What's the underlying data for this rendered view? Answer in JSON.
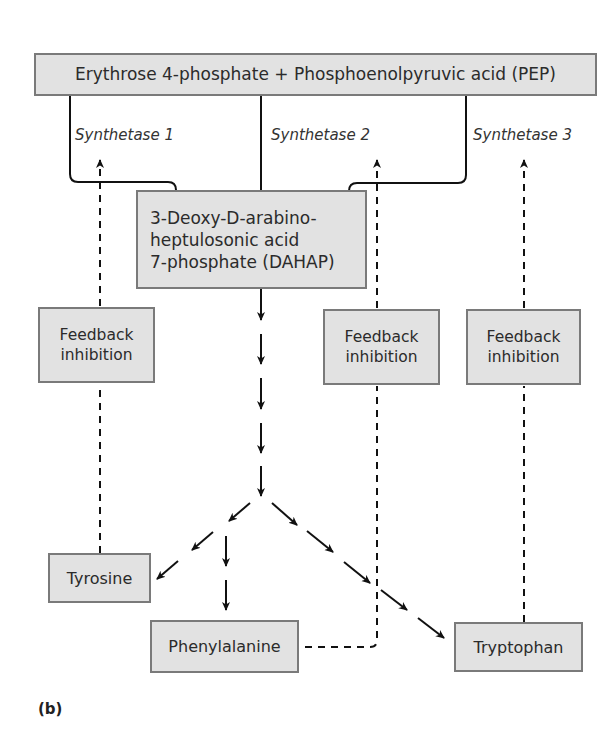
{
  "diagram": {
    "panel_label": "(b)",
    "nodes": {
      "substrates": "Erythrose 4-phosphate + Phosphoenolpyruvic acid (PEP)",
      "dahap": [
        "3-Deoxy-D-arabino-",
        "heptulosonic acid",
        "7-phosphate (DAHAP)"
      ],
      "tyrosine": "Tyrosine",
      "phenylalanine": "Phenylalanine",
      "tryptophan": "Tryptophan"
    },
    "enzymes": [
      "Synthetase 1",
      "Synthetase 2",
      "Synthetase 3"
    ],
    "feedback": [
      {
        "line1": "Feedback",
        "line2": "inhibition"
      },
      {
        "line1": "Feedback",
        "line2": "inhibition"
      },
      {
        "line1": "Feedback",
        "line2": "inhibition"
      }
    ],
    "colors": {
      "box_fill": "#e2e2e2",
      "box_border": "#7a7a7a",
      "line": "#111111"
    }
  }
}
